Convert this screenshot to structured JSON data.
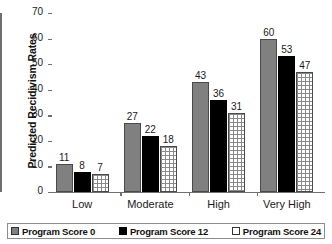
{
  "chart_data": {
    "type": "bar",
    "title": "",
    "xlabel": "",
    "ylabel": "Predicted Recidivism Rates",
    "ylim": [
      0,
      70
    ],
    "yticks": [
      0,
      10,
      20,
      30,
      40,
      50,
      60,
      70
    ],
    "ytick_labels": [
      "0",
      "10",
      "20",
      "30",
      "40",
      "50",
      "60",
      "70"
    ],
    "grid": false,
    "legend_position": "bottom",
    "categories": [
      "Low",
      "Moderate",
      "High",
      "Very High"
    ],
    "series": [
      {
        "name": "Program Score 0",
        "color": "#808080",
        "style": "solid-gray",
        "values": [
          11,
          27,
          43,
          60
        ],
        "labels": [
          "11",
          "27",
          "43",
          "60"
        ]
      },
      {
        "name": "Program Score 12",
        "color": "#000000",
        "style": "solid-black",
        "values": [
          8,
          22,
          36,
          53
        ],
        "labels": [
          "8",
          "22",
          "36",
          "53"
        ]
      },
      {
        "name": "Program Score 24",
        "color": "#ffffff",
        "style": "grid-hatch",
        "values": [
          7,
          18,
          31,
          47
        ],
        "labels": [
          "7",
          "18",
          "31",
          "47"
        ]
      }
    ]
  },
  "axis": {
    "y_title": "Predicted Recidivism Rates"
  },
  "legend": {
    "items": [
      {
        "label": "Program Score 0"
      },
      {
        "label": "Program Score 12"
      },
      {
        "label": "Program Score 24"
      }
    ]
  }
}
